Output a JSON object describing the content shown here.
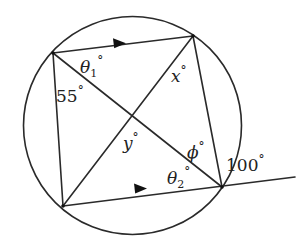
{
  "diagram": {
    "type": "cyclic-quadrilateral",
    "colors": {
      "stroke": "#2a2a2a",
      "text": "#222222",
      "background": "#ffffff"
    },
    "circle": {
      "cx": 132.5,
      "cy": 125.5,
      "r": 109
    },
    "vertices": {
      "A": {
        "x": 53,
        "y": 53
      },
      "B": {
        "x": 193,
        "y": 36
      },
      "C": {
        "x": 222,
        "y": 187
      },
      "D": {
        "x": 63,
        "y": 206
      }
    },
    "extension_end": {
      "x": 295,
      "y": 177
    },
    "parallel_marks": [
      "A-B",
      "D-C"
    ],
    "labels": {
      "theta1": {
        "symbol": "θ",
        "sub": "1",
        "deg": "°"
      },
      "angle55": {
        "value": "55",
        "deg": "°"
      },
      "x": {
        "symbol": "x",
        "deg": "°"
      },
      "y": {
        "symbol": "y",
        "deg": "°"
      },
      "phi": {
        "symbol": "ϕ",
        "deg": "°"
      },
      "theta2": {
        "symbol": "θ",
        "sub": "2",
        "deg": "°"
      },
      "angle100": {
        "value": "100",
        "deg": "°"
      }
    }
  }
}
